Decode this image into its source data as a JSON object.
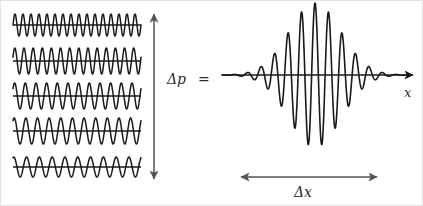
{
  "figure": {
    "background_color": "#ffffff",
    "border_color": "#e3e3e3",
    "stroke_color": "#1a1a1a",
    "arrow_color": "#555555",
    "width": 423,
    "height": 206
  },
  "labels": {
    "delta_p": "Δp",
    "equals": "=",
    "x_axis": "x",
    "delta_x": "Δx"
  },
  "left_panel": {
    "description": "Stack of five sinusoidal plane waves of differing wavelength",
    "x_start": 12,
    "x_end": 140,
    "waves": [
      {
        "index": 0,
        "baseline_y": 24,
        "cycles": 16.0,
        "amplitude": 11,
        "phase": 0.0
      },
      {
        "index": 1,
        "baseline_y": 60,
        "cycles": 14.0,
        "amplitude": 13,
        "phase": 0.3
      },
      {
        "index": 2,
        "baseline_y": 95,
        "cycles": 12.0,
        "amplitude": 13,
        "phase": 0.6
      },
      {
        "index": 3,
        "baseline_y": 130,
        "cycles": 11.0,
        "amplitude": 13,
        "phase": 0.9
      },
      {
        "index": 4,
        "baseline_y": 166,
        "cycles": 10.0,
        "amplitude": 10,
        "phase": 1.2
      }
    ]
  },
  "delta_p_arrow": {
    "orientation": "vertical",
    "double_headed": true,
    "x": 153,
    "y_top": 13,
    "y_bottom": 178
  },
  "right_panel": {
    "description": "Gaussian-modulated wave packet on an x axis",
    "axis": {
      "x_start": 221,
      "x_end": 412,
      "y": 74,
      "arrow_head": "right"
    },
    "packet": {
      "center_x": 314,
      "sigma": 26,
      "cycles_scale": 13.5,
      "peak_amplitude": 72,
      "x_from": 221,
      "x_to": 404
    }
  },
  "delta_x_arrow": {
    "orientation": "horizontal",
    "double_headed": true,
    "y": 176,
    "x_left": 240,
    "x_right": 376
  },
  "chart_data": {
    "type": "line",
    "xlabel": "x",
    "ylabel": "",
    "annotations": [
      "Δp",
      "=",
      "Δx",
      "x"
    ],
    "series": [
      {
        "name": "plane wave 1",
        "cycles": 16.0,
        "amplitude": 11
      },
      {
        "name": "plane wave 2",
        "cycles": 14.0,
        "amplitude": 13
      },
      {
        "name": "plane wave 3",
        "cycles": 12.0,
        "amplitude": 13
      },
      {
        "name": "plane wave 4",
        "cycles": 11.0,
        "amplitude": 13
      },
      {
        "name": "plane wave 5",
        "cycles": 10.0,
        "amplitude": 10
      },
      {
        "name": "wave packet (sum)",
        "envelope": "gaussian",
        "sigma": 26,
        "peak_amplitude": 72,
        "center_x": 314
      }
    ],
    "grid": false,
    "legend": "none"
  }
}
